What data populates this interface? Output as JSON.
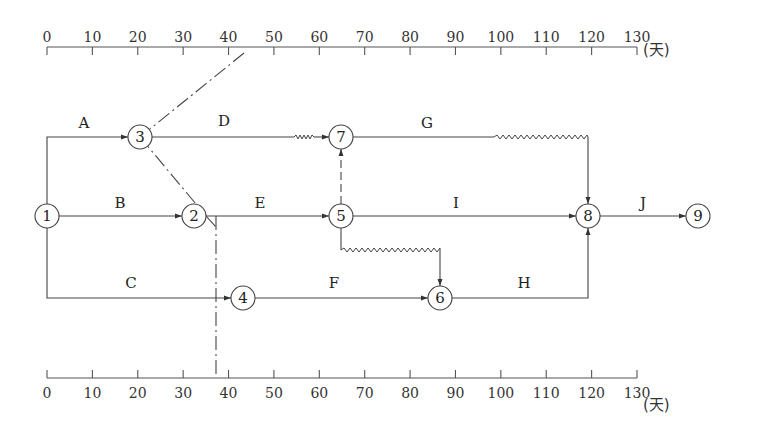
{
  "diagram": {
    "type": "time-scaled-network",
    "unit": "(天)",
    "axis": {
      "ticks": [
        "0",
        "10",
        "20",
        "30",
        "40",
        "50",
        "60",
        "70",
        "80",
        "90",
        "100",
        "110",
        "120",
        "130"
      ],
      "min": 0,
      "max": 130,
      "step": 10
    },
    "check_line_day": 35,
    "nodes": [
      {
        "id": "1",
        "label": "1",
        "day": 0,
        "row": 1
      },
      {
        "id": "2",
        "label": "2",
        "day": 30,
        "row": 1
      },
      {
        "id": "3",
        "label": "3",
        "day": 20,
        "row": 0
      },
      {
        "id": "4",
        "label": "4",
        "day": 40,
        "row": 2
      },
      {
        "id": "5",
        "label": "5",
        "day": 60,
        "row": 1
      },
      {
        "id": "6",
        "label": "6",
        "day": 80,
        "row": 2
      },
      {
        "id": "7",
        "label": "7",
        "day": 60,
        "row": 0
      },
      {
        "id": "8",
        "label": "8",
        "day": 110,
        "row": 1
      },
      {
        "id": "9",
        "label": "9",
        "day": 130,
        "row": 1
      }
    ],
    "activities": [
      {
        "label": "A",
        "from": "1",
        "to": "3"
      },
      {
        "label": "B",
        "from": "1",
        "to": "2"
      },
      {
        "label": "C",
        "from": "1",
        "to": "4"
      },
      {
        "label": "D",
        "from": "3",
        "to": "7",
        "free_float": true
      },
      {
        "label": "E",
        "from": "2",
        "to": "5"
      },
      {
        "label": "F",
        "from": "4",
        "to": "6"
      },
      {
        "label": "G",
        "from": "7",
        "to": "8",
        "free_float": true
      },
      {
        "label": "H",
        "from": "6",
        "to": "8"
      },
      {
        "label": "I",
        "from": "5",
        "to": "8"
      },
      {
        "label": "J",
        "from": "8",
        "to": "9"
      }
    ],
    "dummy_activities": [
      {
        "from": "5",
        "to": "7"
      },
      {
        "from": "5",
        "to": "6",
        "free_float": true
      }
    ],
    "colors": {
      "line": "#444444",
      "text": "#222222",
      "background": "#ffffff"
    }
  }
}
